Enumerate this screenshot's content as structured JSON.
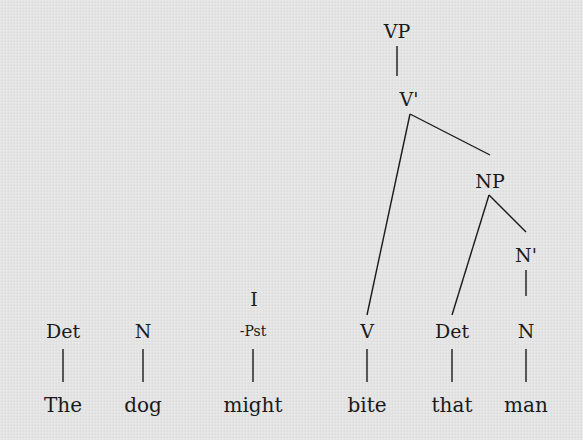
{
  "diagram": {
    "type": "syntax-tree",
    "nodes": [
      {
        "id": "vp",
        "label": "VP"
      },
      {
        "id": "vbar",
        "label": "V'"
      },
      {
        "id": "np",
        "label": "NP"
      },
      {
        "id": "nbar",
        "label": "N'"
      },
      {
        "id": "i",
        "label": "I"
      },
      {
        "id": "i_feat",
        "label": "-Pst"
      },
      {
        "id": "det1",
        "label": "Det"
      },
      {
        "id": "n1",
        "label": "N"
      },
      {
        "id": "v",
        "label": "V"
      },
      {
        "id": "det2",
        "label": "Det"
      },
      {
        "id": "n2",
        "label": "N"
      }
    ],
    "words": [
      {
        "id": "w_the",
        "label": "The"
      },
      {
        "id": "w_dog",
        "label": "dog"
      },
      {
        "id": "w_might",
        "label": "might"
      },
      {
        "id": "w_bite",
        "label": "bite"
      },
      {
        "id": "w_that",
        "label": "that"
      },
      {
        "id": "w_man",
        "label": "man"
      }
    ],
    "edges": [
      [
        "vp",
        "vbar"
      ],
      [
        "vbar",
        "v"
      ],
      [
        "vbar",
        "np"
      ],
      [
        "np",
        "det2"
      ],
      [
        "np",
        "nbar"
      ],
      [
        "nbar",
        "n2"
      ],
      [
        "det1",
        "w_the"
      ],
      [
        "n1",
        "w_dog"
      ],
      [
        "i_feat",
        "w_might"
      ],
      [
        "v",
        "w_bite"
      ],
      [
        "det2",
        "w_that"
      ],
      [
        "n2",
        "w_man"
      ]
    ]
  }
}
